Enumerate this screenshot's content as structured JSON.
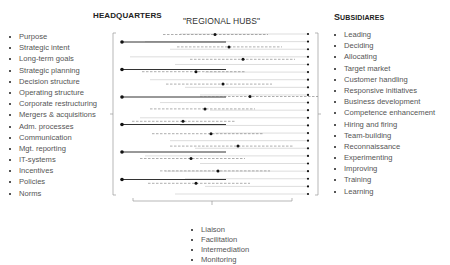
{
  "headers": {
    "headquarters": "HEADQUARTERS",
    "regional_hubs": "\"REGIONAL HUBS\"",
    "subsidiaries_first": "S",
    "subsidiaries_rest": "UBSIDIARES"
  },
  "headquarters_items": [
    "Purpose",
    "Strategic intent",
    "Long-term goals",
    "Strategic planning",
    "Decision structure",
    "Operating structure",
    "Corporate restructuring",
    "Mergers & acquisitions",
    "Adm. processes",
    "Communication",
    "Mgt. reporting",
    "IT-systems",
    "Incentives",
    "Policies",
    "Norms"
  ],
  "subsidiary_items": [
    "Leading",
    "Deciding",
    "Allocating",
    "Target market",
    "Customer handling",
    "Responsive initiatives",
    "Business development",
    "Competence enhancement",
    "Hiring and firing",
    "Team-building",
    "Reconnaissance",
    "Experimenting",
    "Improving",
    "Training",
    "Learning"
  ],
  "regional_hub_items": [
    "Liaison",
    "Facilitation",
    "Intermediation",
    "Monitoring"
  ],
  "diagram": {
    "headquarters_links": 6,
    "regional_hub_links": 13,
    "subsidiary_endpoints": 22,
    "colors": {
      "hq_line": "#333333",
      "hub_line": "#777777",
      "sub_line": "#aaaaaa",
      "bracket": "#999999",
      "dot": "#111111"
    }
  }
}
